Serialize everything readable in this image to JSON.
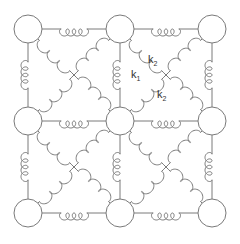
{
  "diagram": {
    "colors": {
      "stroke": "#7a7a7a",
      "background": "#ffffff",
      "node_fill": "#ffffff",
      "label": "#333333"
    },
    "node_radius": 14,
    "nodes": [
      {
        "id": "n00",
        "x": 28,
        "y": 29
      },
      {
        "id": "n01",
        "x": 120,
        "y": 29
      },
      {
        "id": "n02",
        "x": 212,
        "y": 29
      },
      {
        "id": "n10",
        "x": 28,
        "y": 121
      },
      {
        "id": "n11",
        "x": 120,
        "y": 121
      },
      {
        "id": "n12",
        "x": 212,
        "y": 121
      },
      {
        "id": "n20",
        "x": 28,
        "y": 213
      },
      {
        "id": "n21",
        "x": 120,
        "y": 213
      },
      {
        "id": "n22",
        "x": 212,
        "y": 213
      }
    ],
    "springs": {
      "nearest_neighbor_constant": "k",
      "diagonal_constant": "k"
    },
    "labels": [
      {
        "id": "k1",
        "base": "k",
        "sub": "1",
        "x": 131,
        "y": 78
      },
      {
        "id": "k2a",
        "base": "k",
        "sub": "2",
        "x": 148,
        "y": 63
      },
      {
        "id": "k2b",
        "base": "k",
        "sub": "2",
        "x": 157,
        "y": 98
      }
    ]
  }
}
